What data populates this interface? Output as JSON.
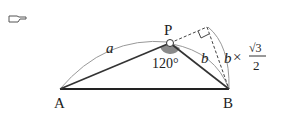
{
  "figure": {
    "marker_icon": "pointing-hand-icon",
    "points": {
      "A": {
        "label": "A",
        "x": 60,
        "y": 89
      },
      "B": {
        "label": "B",
        "x": 229,
        "y": 89
      },
      "P": {
        "label": "P",
        "x": 170,
        "y": 43
      }
    },
    "labels": {
      "side_ap": "a",
      "side_pb": "b",
      "angle_p": "120°",
      "height_b": "b",
      "times": "×",
      "sqrt3": "√3",
      "denominator": "2"
    },
    "colors": {
      "line": "#333333",
      "arc": "#999999",
      "angle_fill": "#8a8a8a",
      "text": "#222222"
    }
  }
}
